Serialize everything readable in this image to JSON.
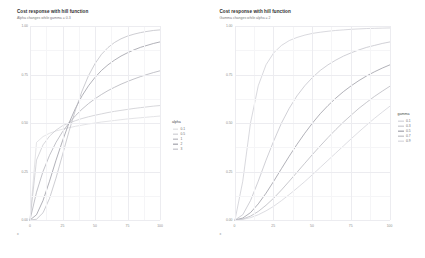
{
  "figure": {
    "background": "#ffffff",
    "panels": [
      {
        "id": "alpha-panel",
        "title": "Cost response with hill function",
        "subtitle": "Alpha changes while gamma = 0.3",
        "legend_title": "alpha"
      },
      {
        "id": "gamma-panel",
        "title": "Cost response with hill function",
        "subtitle": "Gamma changes while alpha = 2",
        "legend_title": "gamma"
      }
    ]
  },
  "chart_data": [
    {
      "type": "line",
      "id": "alpha-panel",
      "title": "Cost response with hill function",
      "subtitle": "Alpha changes while gamma = 0.3",
      "xlabel": "x",
      "ylabel": "",
      "xlim": [
        0,
        100
      ],
      "ylim": [
        0,
        1
      ],
      "grid": true,
      "legend_position": "right",
      "legend_title": "alpha",
      "xticks": [
        0,
        25,
        50,
        75,
        100
      ],
      "xticklabels": [
        "0",
        "25",
        "50",
        "75",
        "100"
      ],
      "yticks": [
        0,
        0.25,
        0.5,
        0.75,
        1
      ],
      "yticklabels": [
        "0.00",
        "0.25",
        "0.50",
        "0.75",
        "1.00"
      ],
      "x": [
        0,
        5,
        10,
        15,
        20,
        25,
        30,
        35,
        40,
        45,
        50,
        55,
        60,
        65,
        70,
        75,
        80,
        85,
        90,
        95,
        100
      ],
      "series": [
        {
          "name": "0.1",
          "color": "#d9d9dd",
          "values": [
            0.0,
            0.4,
            0.43,
            0.447,
            0.459,
            0.468,
            0.476,
            0.483,
            0.489,
            0.495,
            0.5,
            0.505,
            0.509,
            0.513,
            0.517,
            0.521,
            0.524,
            0.527,
            0.53,
            0.533,
            0.536
          ]
        },
        {
          "name": "0.5",
          "color": "#c6c6cc",
          "values": [
            0.0,
            0.309,
            0.387,
            0.432,
            0.463,
            0.486,
            0.5,
            0.512,
            0.523,
            0.532,
            0.54,
            0.547,
            0.554,
            0.56,
            0.565,
            0.57,
            0.575,
            0.579,
            0.583,
            0.587,
            0.59
          ]
        },
        {
          "name": "1",
          "color": "#a9a9b2",
          "values": [
            0.0,
            0.143,
            0.25,
            0.333,
            0.4,
            0.455,
            0.5,
            0.538,
            0.571,
            0.6,
            0.625,
            0.647,
            0.667,
            0.684,
            0.7,
            0.714,
            0.727,
            0.739,
            0.75,
            0.76,
            0.769
          ]
        },
        {
          "name": "2",
          "color": "#8f8f99",
          "values": [
            0.0,
            0.027,
            0.1,
            0.2,
            0.308,
            0.408,
            0.5,
            0.576,
            0.64,
            0.692,
            0.735,
            0.771,
            0.8,
            0.824,
            0.845,
            0.862,
            0.877,
            0.89,
            0.9,
            0.91,
            0.918
          ]
        },
        {
          "name": "3",
          "color": "#b7b7bf",
          "values": [
            0.0,
            0.004,
            0.037,
            0.111,
            0.216,
            0.336,
            0.457,
            0.568,
            0.664,
            0.744,
            0.806,
            0.854,
            0.889,
            0.915,
            0.934,
            0.948,
            0.958,
            0.966,
            0.972,
            0.977,
            0.98
          ]
        }
      ]
    },
    {
      "type": "line",
      "id": "gamma-panel",
      "title": "Cost response with hill function",
      "subtitle": "Gamma changes while alpha = 2",
      "xlabel": "x",
      "ylabel": "",
      "xlim": [
        0,
        100
      ],
      "ylim": [
        0,
        1
      ],
      "grid": true,
      "legend_position": "right",
      "legend_title": "gamma",
      "xticks": [
        0,
        25,
        50,
        75,
        100
      ],
      "xticklabels": [
        "0",
        "25",
        "50",
        "75",
        "100"
      ],
      "yticks": [
        0,
        0.25,
        0.5,
        0.75,
        1
      ],
      "yticklabels": [
        "0.00",
        "0.25",
        "0.50",
        "0.75",
        "1.00"
      ],
      "x": [
        0,
        5,
        10,
        15,
        20,
        25,
        30,
        35,
        40,
        45,
        50,
        55,
        60,
        65,
        70,
        75,
        80,
        85,
        90,
        95,
        100
      ],
      "series": [
        {
          "name": "0.1",
          "color": "#c9c9d0",
          "values": [
            0.0,
            0.2,
            0.5,
            0.692,
            0.8,
            0.862,
            0.9,
            0.925,
            0.941,
            0.953,
            0.962,
            0.968,
            0.973,
            0.977,
            0.98,
            0.983,
            0.985,
            0.987,
            0.988,
            0.989,
            0.99
          ]
        },
        {
          "name": "0.3",
          "color": "#bcbcc4",
          "values": [
            0.0,
            0.027,
            0.1,
            0.2,
            0.308,
            0.408,
            0.5,
            0.576,
            0.64,
            0.692,
            0.735,
            0.771,
            0.8,
            0.824,
            0.845,
            0.862,
            0.877,
            0.89,
            0.9,
            0.91,
            0.918
          ]
        },
        {
          "name": "0.5",
          "color": "#8f8f99",
          "values": [
            0.0,
            0.01,
            0.038,
            0.083,
            0.138,
            0.2,
            0.265,
            0.329,
            0.39,
            0.447,
            0.5,
            0.548,
            0.59,
            0.628,
            0.662,
            0.692,
            0.719,
            0.743,
            0.764,
            0.783,
            0.8
          ]
        },
        {
          "name": "0.7",
          "color": "#b0b0b8",
          "values": [
            0.0,
            0.005,
            0.02,
            0.044,
            0.076,
            0.113,
            0.155,
            0.2,
            0.246,
            0.292,
            0.338,
            0.382,
            0.425,
            0.466,
            0.505,
            0.541,
            0.576,
            0.607,
            0.637,
            0.664,
            0.69
          ]
        },
        {
          "name": "0.9",
          "color": "#cfcfd6",
          "values": [
            0.0,
            0.003,
            0.012,
            0.027,
            0.047,
            0.071,
            0.1,
            0.131,
            0.164,
            0.198,
            0.234,
            0.271,
            0.308,
            0.345,
            0.382,
            0.419,
            0.455,
            0.49,
            0.524,
            0.556,
            0.587
          ]
        }
      ]
    }
  ]
}
